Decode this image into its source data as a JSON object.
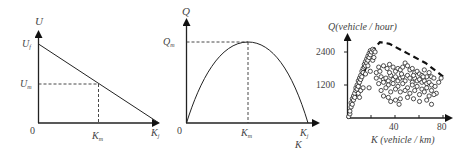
{
  "chart_data": [
    {
      "type": "line",
      "title": "",
      "ylabel": "U",
      "xlabel": "",
      "y_ticks": [
        "U_f",
        "U_m"
      ],
      "x_ticks": [
        "0",
        "K_m",
        "K_j"
      ],
      "labels": {
        "y_axis": "U",
        "uf": "U",
        "uf_sub": "f",
        "um": "U",
        "um_sub": "m",
        "origin": "0",
        "km": "K",
        "km_sub": "m",
        "kj": "K",
        "kj_sub": "j"
      },
      "series": [
        {
          "name": "speed-density",
          "x": [
            0,
            1
          ],
          "y": [
            1,
            0
          ]
        }
      ],
      "annotations": [
        "dashed guide at (K_m, U_m)"
      ],
      "grid": false
    },
    {
      "type": "line",
      "title": "",
      "ylabel": "Q",
      "xlabel": "K",
      "y_ticks": [
        "Q_m"
      ],
      "x_ticks": [
        "0",
        "K_m",
        "K_j"
      ],
      "labels": {
        "y_axis": "Q",
        "qm": "Q",
        "qm_sub": "m",
        "origin": "0",
        "km": "K",
        "km_sub": "m",
        "kj": "K",
        "kj_sub": "j",
        "x_axis": "K"
      },
      "series": [
        {
          "name": "flow-density parabola",
          "x": [
            0,
            0.25,
            0.5,
            0.75,
            1
          ],
          "y": [
            0,
            0.75,
            1,
            0.75,
            0
          ]
        }
      ],
      "annotations": [
        "dashed guide at (K_m, Q_m)"
      ],
      "grid": false
    },
    {
      "type": "scatter",
      "title": "",
      "ylabel": "Q(vehicle / hour)",
      "xlabel": "K (vehicle / km)",
      "y_ticks": [
        1200,
        2400
      ],
      "x_ticks": [
        40,
        80
      ],
      "xlim": [
        0,
        85
      ],
      "ylim": [
        0,
        3000
      ],
      "labels": {
        "y_axis": "Q(vehicle / hour)",
        "x_axis": "K (vehicle / km)",
        "y1": "1200",
        "y2": "2400",
        "x1": "40",
        "x2": "80"
      },
      "envelope": {
        "style": "dashed",
        "x": [
          0,
          20,
          27,
          35,
          50,
          65,
          80
        ],
        "y": [
          0,
          2400,
          2760,
          2700,
          2350,
          2000,
          1500
        ]
      },
      "series": [
        {
          "name": "observations",
          "points": [
            [
              1,
              50
            ],
            [
              2,
              150
            ],
            [
              2,
              250
            ],
            [
              3,
              400
            ],
            [
              3,
              550
            ],
            [
              4,
              500
            ],
            [
              4,
              700
            ],
            [
              5,
              650
            ],
            [
              5,
              800
            ],
            [
              6,
              900
            ],
            [
              6,
              750
            ],
            [
              7,
              1000
            ],
            [
              7,
              1100
            ],
            [
              8,
              1050
            ],
            [
              8,
              1200
            ],
            [
              9,
              1150
            ],
            [
              9,
              1350
            ],
            [
              10,
              1300
            ],
            [
              10,
              1450
            ],
            [
              11,
              1400
            ],
            [
              11,
              1550
            ],
            [
              12,
              1500
            ],
            [
              12,
              1700
            ],
            [
              13,
              1650
            ],
            [
              13,
              1800
            ],
            [
              14,
              1850
            ],
            [
              14,
              1950
            ],
            [
              15,
              1900
            ],
            [
              15,
              2050
            ],
            [
              16,
              2000
            ],
            [
              16,
              2150
            ],
            [
              17,
              2100
            ],
            [
              17,
              2250
            ],
            [
              18,
              2200
            ],
            [
              18,
              2350
            ],
            [
              19,
              2300
            ],
            [
              19,
              2450
            ],
            [
              20,
              2400
            ],
            [
              21,
              2500
            ],
            [
              22,
              2450
            ],
            [
              23,
              2400
            ],
            [
              9,
              900
            ],
            [
              11,
              1000
            ],
            [
              13,
              1100
            ],
            [
              15,
              1600
            ],
            [
              17,
              1900
            ],
            [
              19,
              1700
            ],
            [
              21,
              2100
            ],
            [
              10,
              750
            ],
            [
              22,
              2200
            ],
            [
              18,
              1100
            ],
            [
              26,
              1850
            ],
            [
              30,
              1900
            ],
            [
              33,
              1800
            ],
            [
              35,
              1950
            ],
            [
              38,
              1850
            ],
            [
              40,
              1700
            ],
            [
              42,
              1800
            ],
            [
              44,
              1750
            ],
            [
              46,
              1850
            ],
            [
              48,
              2000
            ],
            [
              50,
              1900
            ],
            [
              52,
              1750
            ],
            [
              54,
              1800
            ],
            [
              56,
              1650
            ],
            [
              58,
              1700
            ],
            [
              60,
              1600
            ],
            [
              62,
              1550
            ],
            [
              64,
              1750
            ],
            [
              66,
              1500
            ],
            [
              68,
              1650
            ],
            [
              70,
              1500
            ],
            [
              72,
              1450
            ],
            [
              76,
              1300
            ],
            [
              78,
              1450
            ],
            [
              24,
              1450
            ],
            [
              28,
              1500
            ],
            [
              30,
              1400
            ],
            [
              32,
              1450
            ],
            [
              34,
              1350
            ],
            [
              36,
              1550
            ],
            [
              38,
              1400
            ],
            [
              40,
              1500
            ],
            [
              42,
              1350
            ],
            [
              44,
              1450
            ],
            [
              46,
              1500
            ],
            [
              48,
              1350
            ],
            [
              50,
              1550
            ],
            [
              52,
              1450
            ],
            [
              54,
              1300
            ],
            [
              56,
              1450
            ],
            [
              58,
              1350
            ],
            [
              60,
              1400
            ],
            [
              62,
              1300
            ],
            [
              64,
              1350
            ],
            [
              66,
              1250
            ],
            [
              68,
              1300
            ],
            [
              70,
              1200
            ],
            [
              26,
              1250
            ],
            [
              30,
              1300
            ],
            [
              34,
              1200
            ],
            [
              38,
              1250
            ],
            [
              42,
              1150
            ],
            [
              46,
              1250
            ],
            [
              50,
              1100
            ],
            [
              54,
              1200
            ],
            [
              58,
              1150
            ],
            [
              62,
              1050
            ],
            [
              66,
              1100
            ],
            [
              70,
              1000
            ],
            [
              74,
              900
            ],
            [
              28,
              1000
            ],
            [
              32,
              1100
            ],
            [
              36,
              950
            ],
            [
              40,
              1050
            ],
            [
              44,
              950
            ],
            [
              48,
              1000
            ],
            [
              52,
              900
            ],
            [
              56,
              1000
            ],
            [
              60,
              850
            ],
            [
              64,
              950
            ],
            [
              68,
              800
            ],
            [
              72,
              850
            ],
            [
              30,
              800
            ],
            [
              34,
              750
            ],
            [
              40,
              650
            ],
            [
              44,
              700
            ],
            [
              50,
              750
            ],
            [
              55,
              700
            ],
            [
              60,
              600
            ],
            [
              66,
              650
            ],
            [
              70,
              500
            ],
            [
              36,
              600
            ],
            [
              43,
              500
            ],
            [
              24,
              1650
            ],
            [
              27,
              1700
            ],
            [
              35,
              1650
            ],
            [
              45,
              1600
            ],
            [
              55,
              1550
            ],
            [
              63,
              1500
            ],
            [
              73,
              1150
            ]
          ]
        }
      ],
      "grid": false
    }
  ]
}
